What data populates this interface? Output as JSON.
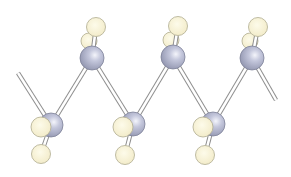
{
  "diagram": {
    "type": "ball-and-stick molecular model",
    "colors": {
      "carbon": "#b8bcd4",
      "carbon_highlight": "#eef0f8",
      "carbon_shadow": "#8c90aa",
      "hydrogen": "#f7f1d0",
      "hydrogen_outline": "#b8b49a",
      "bond": "#ffffff",
      "bond_outline": "#8e8e8e",
      "background": "#ffffff"
    },
    "carbons": [
      {
        "x": 51,
        "y": 125
      },
      {
        "x": 92,
        "y": 58
      },
      {
        "x": 133,
        "y": 124
      },
      {
        "x": 173,
        "y": 57
      },
      {
        "x": 213,
        "y": 124
      },
      {
        "x": 252,
        "y": 58
      }
    ],
    "chain_ends": [
      {
        "x": 18,
        "y": 73
      },
      {
        "x": 276,
        "y": 100
      }
    ],
    "hydrogens_top": [
      {
        "front": {
          "x": 96,
          "y": 27
        },
        "back": {
          "x": 89,
          "y": 41
        }
      },
      {
        "front": {
          "x": 178,
          "y": 26
        },
        "back": {
          "x": 171,
          "y": 40
        }
      },
      {
        "front": {
          "x": 258,
          "y": 27
        },
        "back": {
          "x": 250,
          "y": 41
        }
      }
    ],
    "hydrogens_bottom": [
      {
        "side": {
          "x": 41,
          "y": 127
        },
        "below": {
          "x": 41,
          "y": 154
        }
      },
      {
        "side": {
          "x": 123,
          "y": 127
        },
        "below": {
          "x": 125,
          "y": 155
        }
      },
      {
        "side": {
          "x": 203,
          "y": 127
        },
        "below": {
          "x": 205,
          "y": 155
        }
      }
    ]
  }
}
